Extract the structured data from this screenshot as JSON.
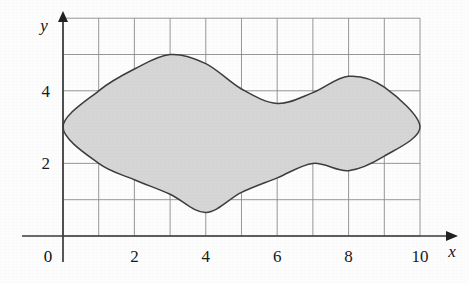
{
  "figure": {
    "background_color": "#fdfdfd",
    "grid_color": "#8c8c8c",
    "axis_color": "#3a3a3a",
    "curve_color": "#3d3d3d",
    "fill_color": "#d6d6d6",
    "label_color": "#1a1a1a"
  },
  "axes": {
    "x_axis_label": "x",
    "y_axis_label": "y",
    "origin_label": "0",
    "x_ticks": [
      {
        "value": 0,
        "label": ""
      },
      {
        "value": 2,
        "label": "2"
      },
      {
        "value": 4,
        "label": "4"
      },
      {
        "value": 6,
        "label": "6"
      },
      {
        "value": 8,
        "label": "8"
      },
      {
        "value": 10,
        "label": "10"
      }
    ],
    "y_ticks": [
      {
        "value": 2,
        "label": "2"
      },
      {
        "value": 4,
        "label": "4"
      }
    ]
  },
  "chart_data": {
    "type": "area",
    "title": "",
    "subtitle": "",
    "xlabel": "x",
    "ylabel": "y",
    "xlim": [
      0,
      10
    ],
    "ylim": [
      0,
      6
    ],
    "grid": true,
    "grid_x_step": 1,
    "grid_y_step": 1,
    "legend": null,
    "annotations": [],
    "series": [
      {
        "name": "region-upper-boundary",
        "x": [
          0,
          1,
          2,
          3,
          4,
          5,
          6,
          7,
          8,
          9,
          10
        ],
        "values": [
          3.0,
          4.0,
          4.6,
          5.0,
          4.75,
          4.05,
          3.65,
          3.95,
          4.4,
          4.1,
          3.0
        ]
      },
      {
        "name": "region-lower-boundary",
        "x": [
          0,
          1,
          2,
          3,
          4,
          5,
          6,
          7,
          8,
          9,
          10
        ],
        "values": [
          3.0,
          2.0,
          1.55,
          1.15,
          0.65,
          1.2,
          1.6,
          2.0,
          1.8,
          2.2,
          3.0
        ]
      }
    ],
    "key_points": {
      "left_tip": [
        0,
        3
      ],
      "right_tip": [
        10,
        3
      ],
      "upper_left_peak": [
        3,
        5
      ],
      "upper_saddle_min": [
        6,
        3.65
      ],
      "upper_right_peak": [
        8,
        4.4
      ],
      "lower_min": [
        4,
        0.65
      ],
      "lower_local_max": [
        7,
        2.0
      ],
      "lower_local_min": [
        8,
        1.8
      ]
    }
  }
}
